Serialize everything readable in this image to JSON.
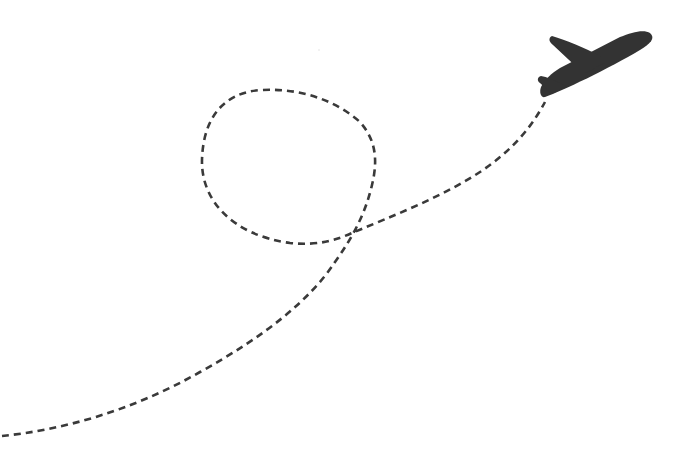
{
  "scene": {
    "description": "Airplane taking off with dashed looping flight path",
    "background_color": "#ffffff",
    "path_color": "#3a3a3a",
    "plane_color": "#333333",
    "icons": {
      "plane": "airplane-icon",
      "path": "dashed-flight-path"
    }
  }
}
